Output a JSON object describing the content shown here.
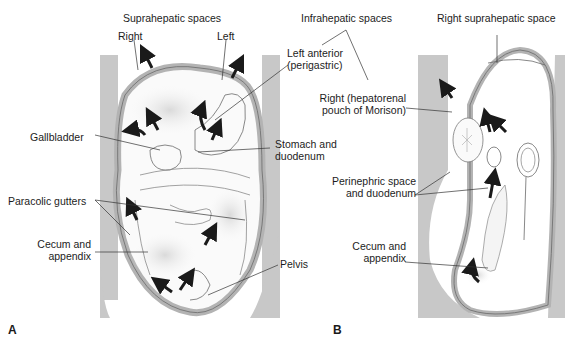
{
  "figure": {
    "panels": [
      {
        "id": "A",
        "letter": "A",
        "view": "anterior abdomen",
        "labels": {
          "suprahepatic_title": "Suprahepatic spaces",
          "right": "Right",
          "left": "Left",
          "left_anterior": [
            "Left anterior",
            "(perigastric)"
          ],
          "gallbladder": "Gallbladder",
          "stomach": [
            "Stomach and",
            "duodenum"
          ],
          "paracolic": "Paracolic gutters",
          "cecum": [
            "Cecum and",
            "appendix"
          ],
          "pelvis": "Pelvis"
        }
      },
      {
        "id": "B",
        "letter": "B",
        "view": "sagittal section",
        "labels": {
          "infrahepatic_title": "Infrahepatic spaces",
          "right_supra": "Right suprahepatic space",
          "morison": [
            "Right (hepatorenal",
            "pouch of Morison)"
          ],
          "perinephric": [
            "Perinephric space",
            "and duodenum"
          ],
          "cecum": [
            "Cecum and",
            "appendix"
          ]
        }
      }
    ],
    "colors": {
      "tissue_gray": "#c4c4c4",
      "peritoneum_gray": "#b8b8b8",
      "organ_outline": "#6a6a6a",
      "arrow": "#1a1a1a",
      "background": "#ffffff"
    }
  }
}
